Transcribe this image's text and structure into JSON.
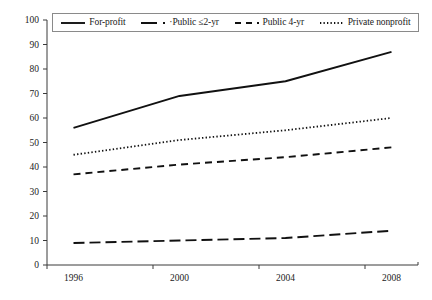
{
  "chart_data": {
    "type": "line",
    "title": "",
    "subtitle": "",
    "xlabel": "",
    "ylabel": "",
    "x": [
      1996,
      2000,
      2004,
      2008
    ],
    "xtick_labels": [
      "1996",
      "2000",
      "2004",
      "2008"
    ],
    "xlim": [
      1995,
      2009
    ],
    "ylim": [
      0,
      100
    ],
    "ytick_labels": [
      "0",
      "10",
      "20",
      "30",
      "40",
      "50",
      "60",
      "70",
      "80",
      "90",
      "100"
    ],
    "ytick_values": [
      0,
      10,
      20,
      30,
      40,
      50,
      60,
      70,
      80,
      90,
      100
    ],
    "grid": false,
    "legend_position": "top",
    "series": [
      {
        "name": "For-profit",
        "style": "solid",
        "color": "#111111",
        "values": [
          56,
          69,
          75,
          87
        ]
      },
      {
        "name": "Public ≤2-yr",
        "style": "long-dash",
        "color": "#111111",
        "values": [
          9,
          10,
          11,
          14
        ]
      },
      {
        "name": "Public 4-yr",
        "style": "dash",
        "color": "#111111",
        "values": [
          37,
          41,
          44,
          48
        ]
      },
      {
        "name": "Private nonprofit",
        "style": "dotted",
        "color": "#111111",
        "values": [
          45,
          51,
          55,
          60
        ]
      }
    ]
  },
  "legend": {
    "items": [
      {
        "label": "For-profit",
        "swatch": "solid-line-swatch"
      },
      {
        "label": "·Public ≤2-yr",
        "swatch": "long-dash-line-swatch"
      },
      {
        "label": "Public 4-yr",
        "swatch": "dash-line-swatch"
      },
      {
        "label": "Private nonprofit",
        "swatch": "dotted-line-swatch"
      }
    ]
  },
  "axes": {
    "y_labels": [
      "100",
      "90",
      "80",
      "70",
      "60",
      "50",
      "40",
      "30",
      "20",
      "10",
      "0"
    ],
    "x_labels": [
      "1996",
      "2000",
      "2004",
      "2008"
    ]
  }
}
